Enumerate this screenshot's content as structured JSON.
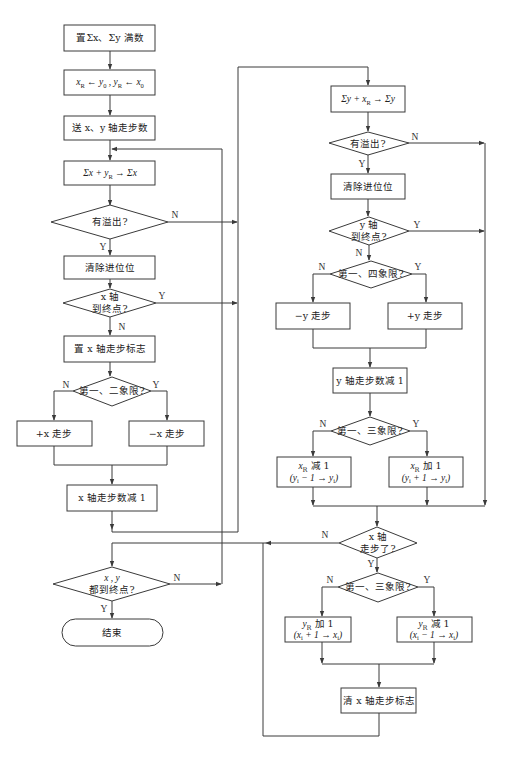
{
  "diagram": {
    "left": {
      "init_sums": "置Σx、Σy 满数",
      "init_regs": [
        "x",
        "R",
        " ← y",
        "0",
        " , y",
        "R",
        " ← x",
        "0"
      ],
      "send_steps": "送 x、y 轴走步数",
      "sum_x": [
        "Σx + y",
        "R",
        " → Σx"
      ],
      "overflow_q": "有溢出?",
      "clear_carry": "清除进位位",
      "x_end_q": [
        "x 轴",
        "到终点?"
      ],
      "set_x_flag": "置 x 轴走步标志",
      "quad_12_q": "第一、二象限?",
      "plus_x": "+x 走步",
      "minus_x": "−x 走步",
      "x_dec": "x 轴走步数减 1",
      "xy_end_q": [
        "x , y",
        "都到终点?"
      ],
      "end": "结束"
    },
    "right": {
      "sum_y": [
        "Σy + x",
        "R",
        " → Σy"
      ],
      "overflow_q": "有溢出?",
      "clear_carry": "清除进位位",
      "y_end_q": [
        "y 轴",
        "到终点?"
      ],
      "quad_14_q": "第一、四象限?",
      "minus_y": "−y 走步",
      "plus_y": "+y 走步",
      "y_dec": "y 轴走步数减 1",
      "quad_13_q_a": "第一、三象限?",
      "xr_dec": {
        "line1": [
          "x",
          "R",
          " 减 1"
        ],
        "line2": [
          "(y",
          "i",
          " − 1 → y",
          "i",
          ")"
        ]
      },
      "xr_inc": {
        "line1": [
          "x",
          "R",
          " 加 1"
        ],
        "line2": [
          "(y",
          "i",
          " + 1 → y",
          "i",
          ")"
        ]
      },
      "x_stepped_q": [
        "x 轴",
        "走步了?"
      ],
      "quad_13_q_b": "第一、三象限?",
      "yr_inc": {
        "line1": [
          "y",
          "R",
          " 加 1"
        ],
        "line2": [
          "(x",
          "i",
          " + 1 → x",
          "i",
          ")"
        ]
      },
      "yr_dec": {
        "line1": [
          "y",
          "R",
          " 减 1"
        ],
        "line2": [
          "(x",
          "i",
          " − 1 → x",
          "i",
          ")"
        ]
      },
      "clear_x_flag": "清 x 轴走步标志"
    },
    "edge_labels": {
      "yes": "Y",
      "no": "N"
    },
    "colors": {
      "stroke": "#3a3a3a",
      "text": "#222222",
      "background": "#ffffff"
    }
  }
}
